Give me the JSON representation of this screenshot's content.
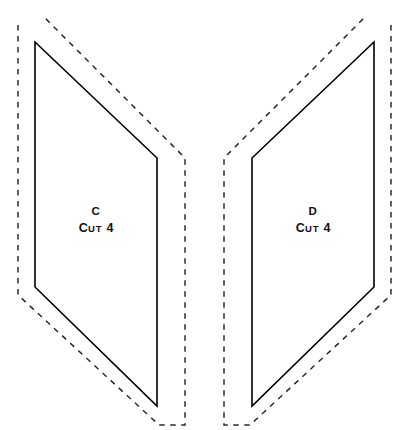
{
  "document": {
    "type": "sewing-pattern-sheet",
    "background_color": "#ffffff",
    "line_color": "#000000",
    "seam_line_color": "#2b2b2b",
    "width": 405,
    "height": 430
  },
  "pieces": [
    {
      "id": "piece-c",
      "letter": "C",
      "cut_label_lead": "C",
      "cut_label_rest": "UT",
      "cut_quantity": "4",
      "cut_line_points": "35,42 157,158 157,406 35,287",
      "seam_line_points": "18,25 18,295 159,425 185,425 185,158 43,16",
      "label_x": 96,
      "label_letter_y": 212,
      "label_cut_y": 228
    },
    {
      "id": "piece-d",
      "letter": "D",
      "cut_label_lead": "C",
      "cut_label_rest": "UT",
      "cut_quantity": "4",
      "cut_line_points": "374,42 252,158 252,406 374,287",
      "seam_line_points": "391,25 391,295 250,425 224,425 224,158 366,16",
      "label_x": 313,
      "label_letter_y": 212,
      "label_cut_y": 228
    }
  ]
}
